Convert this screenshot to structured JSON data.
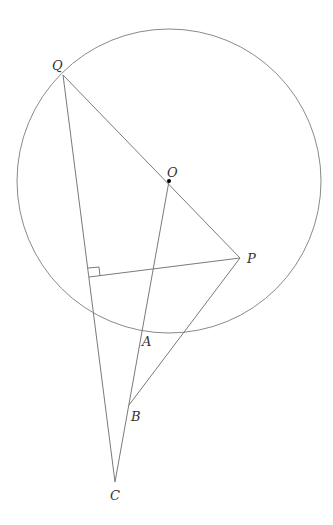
{
  "diagram": {
    "type": "geometry",
    "circle": {
      "center": "O",
      "cx": 169,
      "cy": 181,
      "r": 152
    },
    "points": {
      "Q": {
        "label": "Q",
        "x": 63,
        "y": 75,
        "lx": 52,
        "ly": 70
      },
      "O": {
        "label": "O",
        "x": 169,
        "y": 181,
        "lx": 167,
        "ly": 177
      },
      "P": {
        "label": "P",
        "x": 240,
        "y": 258,
        "lx": 247,
        "ly": 263
      },
      "A": {
        "label": "A",
        "x": 142,
        "y": 331,
        "lx": 142,
        "ly": 346
      },
      "B": {
        "label": "B",
        "x": 129,
        "y": 405,
        "lx": 131,
        "ly": 421
      },
      "C": {
        "label": "C",
        "x": 115,
        "y": 482,
        "lx": 110,
        "ly": 500
      },
      "F": {
        "label": "",
        "x": 89,
        "y": 277
      }
    },
    "segments": [
      [
        "Q",
        "P"
      ],
      [
        "Q",
        "C"
      ],
      [
        "O",
        "C"
      ],
      [
        "P",
        "B"
      ],
      [
        "P",
        "F"
      ]
    ],
    "right_angle_at": "F",
    "colors": {
      "stroke": "#7a7a7a",
      "point": "#000000"
    }
  }
}
